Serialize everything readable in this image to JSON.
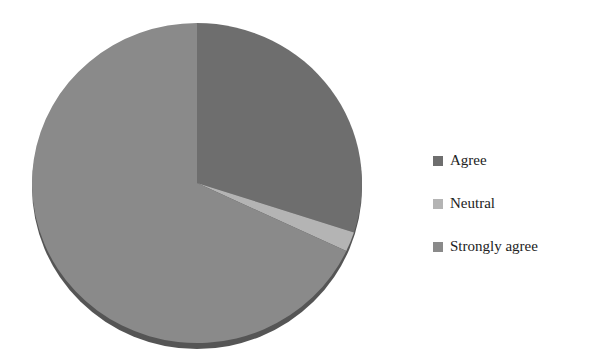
{
  "chart_data": {
    "type": "pie",
    "title": "",
    "labels": [
      "Agree",
      "Neutral",
      "Strongly agree"
    ],
    "values": [
      30,
      2,
      68
    ],
    "colors": [
      "#6e6e6e",
      "#b4b4b4",
      "#8a8a8a"
    ],
    "start_angle_deg": 0,
    "direction": "clockwise",
    "legend_position": "right"
  },
  "legend": {
    "items": [
      {
        "label": "Agree",
        "color": "#6e6e6e"
      },
      {
        "label": "Neutral",
        "color": "#b4b4b4"
      },
      {
        "label": "Strongly agree",
        "color": "#8a8a8a"
      }
    ]
  }
}
